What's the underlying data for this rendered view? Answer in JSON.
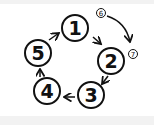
{
  "diagram": {
    "type": "cycle",
    "colors": {
      "background": "#ffffff",
      "frame": "#f2f2f2",
      "stroke": "#111111"
    },
    "nodes": [
      {
        "id": "1",
        "label": "1",
        "cx": 75,
        "cy": 28,
        "r": 13
      },
      {
        "id": "2",
        "label": "2",
        "cx": 111,
        "cy": 61,
        "r": 13
      },
      {
        "id": "3",
        "label": "3",
        "cx": 91,
        "cy": 95,
        "r": 13
      },
      {
        "id": "4",
        "label": "4",
        "cx": 47,
        "cy": 91,
        "r": 13
      },
      {
        "id": "5",
        "label": "5",
        "cx": 38,
        "cy": 53,
        "r": 13
      }
    ],
    "small_nodes": [
      {
        "id": "6",
        "label": "6",
        "cx": 101,
        "cy": 13,
        "r": 4.5
      },
      {
        "id": "7",
        "label": "7",
        "cx": 133,
        "cy": 54,
        "r": 4.5
      }
    ],
    "edges": [
      {
        "from": "1",
        "to": "2"
      },
      {
        "from": "2",
        "to": "3"
      },
      {
        "from": "3",
        "to": "4"
      },
      {
        "from": "4",
        "to": "5"
      },
      {
        "from": "5",
        "to": "1"
      },
      {
        "from": "6",
        "to": "7",
        "curved": true
      }
    ]
  }
}
